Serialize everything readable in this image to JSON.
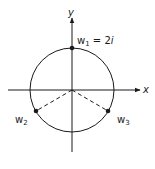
{
  "diagram": {
    "axes": {
      "x_label": "x",
      "y_label": "y"
    },
    "circle": {
      "description": "circle centered at origin of radius 2"
    },
    "points": [
      {
        "name": "w1",
        "base": "w",
        "sub": "1",
        "eq": " = 2",
        "eq_var": "i"
      },
      {
        "name": "w2",
        "base": "w",
        "sub": "2"
      },
      {
        "name": "w3",
        "base": "w",
        "sub": "3"
      }
    ],
    "colors": {
      "stroke": "#1a1a1a",
      "background": "#ffffff"
    }
  }
}
